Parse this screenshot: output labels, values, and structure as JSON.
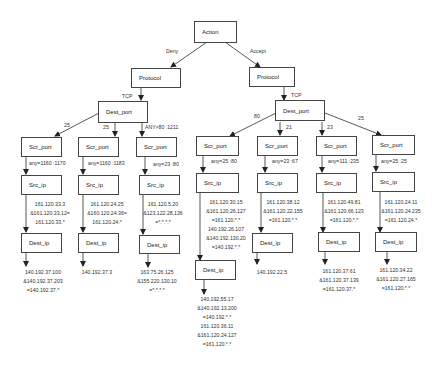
{
  "diagram": {
    "root": {
      "label": "Action"
    },
    "edges_root": {
      "deny": "Deny",
      "accept": "Accept"
    },
    "left": {
      "protocol": "Protocol",
      "protocol_edge": "TCP",
      "dest_port": "Dest_port",
      "branches": [
        {
          "port_edge": "25",
          "scr_port": "Scr_port",
          "scr_edge": "any=1160 :1170",
          "src_ip": "Src_ip",
          "src_ip_values": [
            "161.120.33.3",
            "&161.120.33.12=",
            "161.120.33.*"
          ],
          "dest_ip": "Dest_ip",
          "dest_ip_values": [
            "140.192.37.100",
            "&140.192.37.203",
            "=140.192.37.*"
          ]
        },
        {
          "port_edge": "25",
          "scr_port": "Scr_port",
          "scr_edge": "any=1160 :1183",
          "src_ip": "Src_ip",
          "src_ip_values": [
            "161.120.24.25",
            "&160.120.24.36=",
            "161.120.24.*"
          ],
          "dest_ip": "Dest_ip",
          "dest_ip_values": [
            "140.192.37.3"
          ]
        },
        {
          "port_edge": "ANY≠80 :1211",
          "scr_port": "Scr_port",
          "scr_edge": "any=23 :80",
          "src_ip": "Src_ip",
          "src_ip_values": [
            "161.120.5.20",
            "&123.122.28.136",
            "=*.*.*.*"
          ],
          "dest_ip": "Dest_ip",
          "dest_ip_values": [
            "163.75.26.125",
            "&155.220.130.10",
            "=*.*.*.*"
          ]
        }
      ]
    },
    "right": {
      "protocol": "Protocol",
      "protocol_edge": "TCP",
      "dest_port": "Dest_port",
      "branches": [
        {
          "port_edge": "80",
          "scr_port": "Scr_port",
          "scr_edge": "any=25 :80",
          "src_ip": "Src_ip",
          "src_ip_values": [
            "161.120.30.15",
            "&161.120.26.127",
            "=161.120.*.*",
            "140.192.26.107",
            "&140.192.130.20",
            "=140.192.*.*"
          ],
          "dest_ip": "Dest_ip",
          "dest_ip_values": [
            "140.192.55.17",
            "&140.192.13.200",
            "=140.192.*.*",
            "161.120.36.11",
            "&161.120.24.127",
            "=161.120.*.*"
          ]
        },
        {
          "port_edge": "21",
          "scr_port": "Scr_port",
          "scr_edge": "any=23 :67",
          "src_ip": "Src_ip",
          "src_ip_values": [
            "161.120.38.12",
            "&161.120.22.155",
            "=161.120.*.*"
          ],
          "dest_ip": "Dest_ip",
          "dest_ip_values": [
            "140.192.22.5"
          ]
        },
        {
          "port_edge": "23",
          "scr_port": "Scr_port",
          "scr_edge": "any=111 :235",
          "src_ip": "Src_ip",
          "src_ip_values": [
            "161.120.49.81",
            "&161.120.66.123",
            "=161.120.*.*"
          ],
          "dest_ip": "Dest_ip",
          "dest_ip_values": [
            "161.120.37.61",
            "&161.120.37.139",
            "=161.120.37.*"
          ]
        },
        {
          "port_edge": "25",
          "scr_port": "Scr_port",
          "scr_edge": "any=25 :25",
          "src_ip": "Src_ip",
          "src_ip_values": [
            "161.120.24.11",
            "&161.120.24.235",
            "=161.120.24.*"
          ],
          "dest_ip": "Dest_ip",
          "dest_ip_values": [
            "161.120.34.22",
            "&161.120.27.165",
            "=161.120.*.*"
          ]
        }
      ]
    }
  }
}
